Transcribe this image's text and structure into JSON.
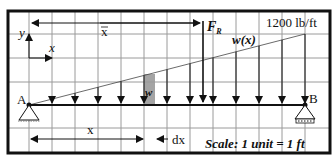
{
  "figure": {
    "load_label": "1200 lb/ft",
    "resultant_label": "F",
    "resultant_subscript": "R",
    "load_function_label": "w(x)",
    "strip_label": "w",
    "xbar_label": "x",
    "x_dim_label": "x",
    "dx_label": "dx",
    "axis_y_label": "y",
    "axis_x_label": "x",
    "support_a_label": "A",
    "support_b_label": "B",
    "scale_label": "Scale: 1 unit = 1 ft"
  },
  "colors": {
    "grid": "#9a9a9a",
    "border": "#111111",
    "strip": "#9a9a9a",
    "ink": "#111111"
  },
  "grid": {
    "vertical_x": [
      29,
      52,
      75,
      98,
      121,
      144,
      167,
      190,
      213,
      236,
      259,
      282,
      305
    ],
    "horizontal_y": [
      34,
      58,
      82,
      128
    ]
  },
  "load_arrows_x": [
    52,
    75,
    98,
    121,
    144,
    167,
    190,
    213,
    236,
    259,
    282,
    305
  ]
}
